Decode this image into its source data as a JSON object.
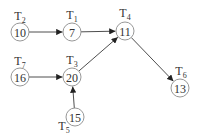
{
  "diagram": {
    "type": "directed-graph",
    "colors": {
      "edge": "#3a3a3a",
      "node_stroke": "#8c8c8c",
      "text": "#333333",
      "background": "#ffffff"
    },
    "nodes": [
      {
        "id": "T2",
        "label": "T",
        "sub": "2",
        "value": "10",
        "cx": 20,
        "cy": 32,
        "lx": 20,
        "ly": 20
      },
      {
        "id": "T1",
        "label": "T",
        "sub": "1",
        "value": "7",
        "cx": 72,
        "cy": 32,
        "lx": 72,
        "ly": 19
      },
      {
        "id": "T4",
        "label": "T",
        "sub": "4",
        "value": "11",
        "cx": 125,
        "cy": 31,
        "lx": 125,
        "ly": 17
      },
      {
        "id": "T7",
        "label": "T",
        "sub": "7",
        "value": "16",
        "cx": 20,
        "cy": 77,
        "lx": 20,
        "ly": 65
      },
      {
        "id": "T3",
        "label": "T",
        "sub": "3",
        "value": "20",
        "cx": 72,
        "cy": 77,
        "lx": 72,
        "ly": 64
      },
      {
        "id": "T5",
        "label": "T",
        "sub": "5",
        "value": "15",
        "cx": 75,
        "cy": 117,
        "lx": 64,
        "ly": 130
      },
      {
        "id": "T6",
        "label": "T",
        "sub": "6",
        "value": "13",
        "cx": 180,
        "cy": 88,
        "lx": 181,
        "ly": 75
      }
    ],
    "edges": [
      {
        "from": "T2",
        "to": "T1"
      },
      {
        "from": "T1",
        "to": "T4"
      },
      {
        "from": "T7",
        "to": "T3"
      },
      {
        "from": "T5",
        "to": "T3"
      },
      {
        "from": "T3",
        "to": "T4"
      },
      {
        "from": "T4",
        "to": "T6"
      }
    ]
  }
}
